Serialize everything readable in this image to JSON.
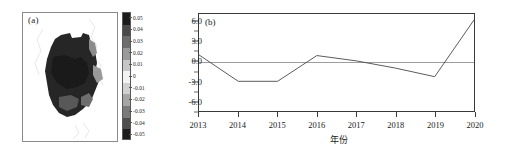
{
  "figure": {
    "background": "#ffffff",
    "line_color": "#4a4a4a",
    "axis_color": "#3a3a3a",
    "zero_line_color": "#9d9d9d"
  },
  "panel_a": {
    "label": "(a)",
    "name": "spatial-distribution-map",
    "colorbar": {
      "ticks": [
        "0.05",
        "0.04",
        "0.03",
        "0.02",
        "0.01",
        "0",
        "-0.01",
        "-0.02",
        "-0.03",
        "-0.04",
        "-0.05"
      ],
      "max": 0.05,
      "min": -0.05,
      "colors": [
        "#1c1c1c",
        "#4a4a4a",
        "#6e6e6e",
        "#9a9a9a",
        "#c6c6c6",
        "#f2f2f2",
        "#d0d0d0",
        "#a6a6a6",
        "#7a7a7a",
        "#4e4e4e",
        "#1c1c1c"
      ]
    }
  },
  "panel_b": {
    "label": "(b)",
    "name": "annual-trend-line-chart"
  },
  "chart_data": {
    "type": "line",
    "title": "(b)",
    "xlabel": "年份",
    "ylabel": "",
    "categories": [
      "2013",
      "2014",
      "2015",
      "2016",
      "2017",
      "2018",
      "2019",
      "2020"
    ],
    "x": [
      2013,
      2014,
      2015,
      2016,
      2017,
      2018,
      2019,
      2020
    ],
    "values": [
      1.0,
      -3.0,
      -3.0,
      0.9,
      0.1,
      -1.0,
      -2.3,
      6.3
    ],
    "ylim": [
      -7.5,
      7.2
    ],
    "xlim": [
      2013,
      2020
    ],
    "yticks": [
      "6.0",
      "3.0",
      "0.0",
      "-3.0",
      "-6.0"
    ],
    "ytick_values": [
      6.0,
      3.0,
      0.0,
      -3.0,
      -6.0
    ],
    "grid": false,
    "zero_reference_line": 0.0,
    "legend": null
  }
}
